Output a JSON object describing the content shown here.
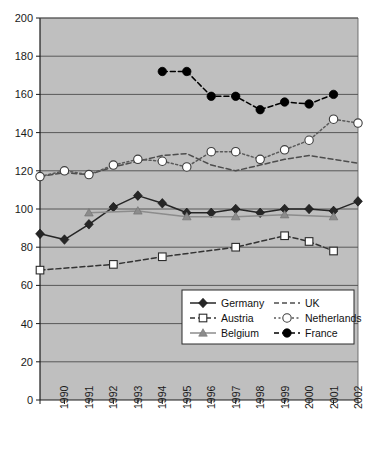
{
  "chart_data": {
    "type": "line",
    "title": "",
    "xlabel": "",
    "ylabel": "",
    "xlim": [
      1989,
      2002
    ],
    "ylim": [
      0,
      200
    ],
    "ytick_step": 20,
    "yticks": [
      0,
      20,
      40,
      60,
      80,
      100,
      120,
      140,
      160,
      180,
      200
    ],
    "x": [
      1989,
      1990,
      1991,
      1992,
      1993,
      1994,
      1995,
      1996,
      1997,
      1998,
      1999,
      2000,
      2001,
      2002
    ],
    "xticklabels": [
      "",
      "1990",
      "1991",
      "1992",
      "1993",
      "1994",
      "1995",
      "1996",
      "1997",
      "1998",
      "1999",
      "2000",
      "2001",
      "2002"
    ],
    "grid": "horizontal",
    "plot_background": "#bfbfbf",
    "legend_position": "bottom-right",
    "series": [
      {
        "name": "Germany",
        "marker": "filled-diamond",
        "linestyle": "solid",
        "color": "#262626",
        "x": [
          1989,
          1990,
          1991,
          1992,
          1993,
          1994,
          1995,
          1996,
          1997,
          1998,
          1999,
          2000,
          2001,
          2002
        ],
        "values": [
          87,
          84,
          92,
          101,
          107,
          103,
          98,
          98,
          100,
          98,
          100,
          100,
          99,
          104
        ]
      },
      {
        "name": "Austria",
        "marker": "open-square",
        "linestyle": "dashed",
        "color": "#333333",
        "x": [
          1989,
          1992,
          1994,
          1997,
          1999,
          2000,
          2001
        ],
        "values": [
          68,
          71,
          75,
          80,
          86,
          83,
          78
        ]
      },
      {
        "name": "Belgium",
        "marker": "filled-triangle",
        "linestyle": "solid",
        "color": "#8c8c8c",
        "x": [
          1991,
          1993,
          1995,
          1997,
          1999,
          2001
        ],
        "values": [
          98,
          99,
          96,
          96,
          97,
          96
        ]
      },
      {
        "name": "UK",
        "marker": "none",
        "linestyle": "dashed",
        "color": "#4d4d4d",
        "x": [
          1989,
          1990,
          1991,
          1992,
          1993,
          1994,
          1995,
          1996,
          1997,
          1998,
          1999,
          2000,
          2001,
          2002
        ],
        "values": [
          117,
          119,
          118,
          122,
          125,
          128,
          129,
          123,
          120,
          123,
          126,
          128,
          126,
          124
        ]
      },
      {
        "name": "Netherlands",
        "marker": "open-circle",
        "linestyle": "dotted",
        "color": "#595959",
        "x": [
          1989,
          1990,
          1991,
          1992,
          1993,
          1994,
          1995,
          1996,
          1997,
          1998,
          1999,
          2000,
          2001,
          2002
        ],
        "values": [
          117,
          120,
          118,
          123,
          126,
          125,
          122,
          130,
          130,
          126,
          131,
          136,
          147,
          145
        ]
      },
      {
        "name": "France",
        "marker": "filled-circle",
        "linestyle": "dashed",
        "color": "#000000",
        "x": [
          1994,
          1995,
          1996,
          1997,
          1998,
          1999,
          2000,
          2001
        ],
        "values": [
          172,
          172,
          159,
          159,
          152,
          156,
          155,
          160
        ]
      }
    ],
    "legend": [
      {
        "label": "Germany",
        "marker": "filled-diamond",
        "linestyle": "solid",
        "color": "#262626"
      },
      {
        "label": "UK",
        "marker": "none",
        "linestyle": "dashed",
        "color": "#4d4d4d"
      },
      {
        "label": "Austria",
        "marker": "open-square",
        "linestyle": "dashed",
        "color": "#333333"
      },
      {
        "label": "Netherlands",
        "marker": "open-circle",
        "linestyle": "dotted",
        "color": "#595959"
      },
      {
        "label": "Belgium",
        "marker": "filled-triangle",
        "linestyle": "solid",
        "color": "#8c8c8c"
      },
      {
        "label": "France",
        "marker": "filled-circle",
        "linestyle": "dashed",
        "color": "#000000"
      }
    ]
  },
  "caption": {
    "text": ""
  }
}
